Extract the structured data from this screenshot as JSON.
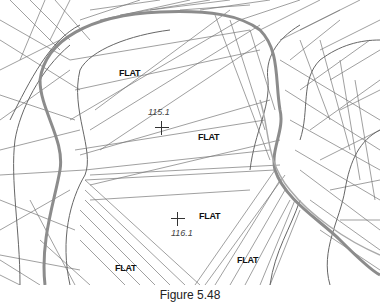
{
  "figure": {
    "caption": "Figure 5.48",
    "flat_labels": [
      "FLAT",
      "FLAT",
      "FLAT",
      "FLAT",
      "FLAT"
    ],
    "spot_elevations": [
      "115.1",
      "116.1"
    ],
    "colors": {
      "mesh_line": "#6e6e6e",
      "ridge_line": "#8a8a8a",
      "label": "#111111",
      "background": "#ffffff"
    }
  }
}
